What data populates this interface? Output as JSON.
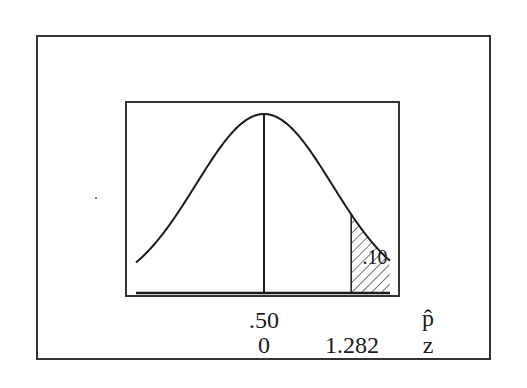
{
  "chart_data": {
    "type": "area",
    "title": "",
    "distribution": "normal",
    "mean_phat": ".50",
    "mean_z": "0",
    "critical_z": "1.282",
    "tail_area": ".10",
    "tail": "right",
    "axes": [
      {
        "name": "p-hat",
        "symbol": "p̂",
        "ticks": [
          ".50"
        ]
      },
      {
        "name": "z",
        "symbol": "z",
        "ticks": [
          "0",
          "1.282"
        ]
      }
    ],
    "grid": false,
    "legend": null
  },
  "labels": {
    "tail_area": ".10",
    "phat_center": ".50",
    "phat_axis": "p̂",
    "z_center": "0",
    "z_critical": "1.282",
    "z_axis": "z"
  },
  "colors": {
    "line": "#1a1a1a",
    "frame": "#333333",
    "background": "#ffffff"
  }
}
